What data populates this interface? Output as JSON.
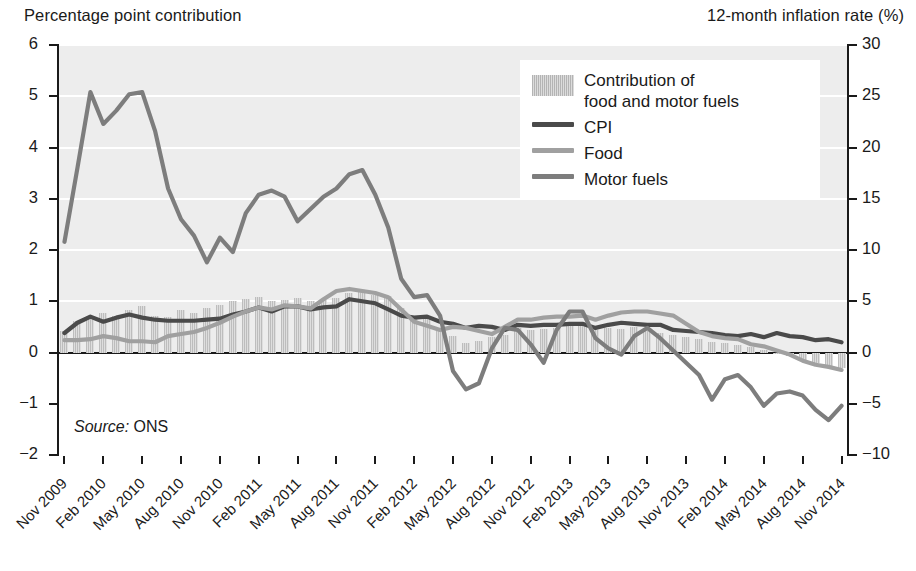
{
  "axes": {
    "left_caption": "Percentage point contribution",
    "right_caption": "12-month inflation rate (%)",
    "left_ticks": [
      "6",
      "5",
      "4",
      "3",
      "2",
      "1",
      "0",
      "-1",
      "-2"
    ],
    "right_ticks": [
      "30",
      "25",
      "20",
      "15",
      "10",
      "5",
      "0",
      "-5",
      "-10"
    ]
  },
  "source": {
    "prefix": "Source:",
    "value": "ONS"
  },
  "legend": {
    "items": [
      {
        "label": "Contribution of\nfood and motor fuels",
        "type": "bar",
        "color": "#c9c9c9"
      },
      {
        "label": "CPI",
        "type": "line",
        "color": "#4a4a4a"
      },
      {
        "label": "Food",
        "type": "line",
        "color": "#a0a0a0"
      },
      {
        "label": "Motor fuels",
        "type": "line",
        "color": "#7d7d7d"
      }
    ]
  },
  "chart_data": {
    "type": "line",
    "title": "",
    "xlabel": "",
    "ylabel": "Percentage point contribution",
    "y2label": "12-month inflation rate (%)",
    "ylim": [
      -2,
      6
    ],
    "y2lim": [
      -10,
      30
    ],
    "grid": true,
    "legend_position": "top-right",
    "x": [
      "Nov 2009",
      "Dec 2009",
      "Jan 2010",
      "Feb 2010",
      "Mar 2010",
      "Apr 2010",
      "May 2010",
      "Jun 2010",
      "Jul 2010",
      "Aug 2010",
      "Sep 2010",
      "Oct 2010",
      "Nov 2010",
      "Dec 2010",
      "Jan 2011",
      "Feb 2011",
      "Mar 2011",
      "Apr 2011",
      "May 2011",
      "Jun 2011",
      "Jul 2011",
      "Aug 2011",
      "Sep 2011",
      "Oct 2011",
      "Nov 2011",
      "Dec 2011",
      "Jan 2012",
      "Feb 2012",
      "Mar 2012",
      "Apr 2012",
      "May 2012",
      "Jun 2012",
      "Jul 2012",
      "Aug 2012",
      "Sep 2012",
      "Oct 2012",
      "Nov 2012",
      "Dec 2012",
      "Jan 2013",
      "Feb 2013",
      "Mar 2013",
      "Apr 2013",
      "May 2013",
      "Jun 2013",
      "Jul 2013",
      "Aug 2013",
      "Sep 2013",
      "Oct 2013",
      "Nov 2013",
      "Dec 2013",
      "Jan 2014",
      "Feb 2014",
      "Mar 2014",
      "Apr 2014",
      "May 2014",
      "Jun 2014",
      "Jul 2014",
      "Aug 2014",
      "Sep 2014",
      "Oct 2014",
      "Nov 2014"
    ],
    "x_tick_labels": [
      "Nov 2009",
      "Feb 2010",
      "May 2010",
      "Aug 2010",
      "Nov 2010",
      "Feb 2011",
      "May 2011",
      "Aug 2011",
      "Nov 2011",
      "Feb 2012",
      "May 2012",
      "Aug 2012",
      "Nov 2012",
      "Feb 2013",
      "May 2013",
      "Aug 2013",
      "Nov 2013",
      "Feb 2014",
      "May 2014",
      "Aug 2014",
      "Nov 2014"
    ],
    "series": [
      {
        "name": "Contribution of food and motor fuels",
        "type": "bar",
        "axis": "left",
        "units": "percentage points",
        "color": "#c9c9c9",
        "values": [
          0.42,
          0.62,
          0.7,
          0.78,
          0.72,
          0.82,
          0.9,
          0.72,
          0.7,
          0.82,
          0.78,
          0.86,
          0.92,
          1.0,
          1.04,
          1.08,
          1.0,
          1.02,
          1.06,
          1.0,
          1.02,
          1.06,
          1.16,
          1.22,
          1.12,
          1.1,
          0.86,
          0.72,
          0.66,
          0.48,
          0.32,
          0.18,
          0.22,
          0.3,
          0.34,
          0.48,
          0.44,
          0.46,
          0.48,
          0.52,
          0.56,
          0.44,
          0.48,
          0.46,
          0.5,
          0.42,
          0.38,
          0.34,
          0.3,
          0.26,
          0.2,
          0.18,
          0.14,
          0.1,
          0.04,
          -0.02,
          -0.06,
          -0.14,
          -0.2,
          -0.26,
          -0.3
        ]
      },
      {
        "name": "CPI",
        "type": "line",
        "axis": "right",
        "units": "%",
        "color": "#4a4a4a",
        "values": [
          1.9,
          2.9,
          3.5,
          3.0,
          3.4,
          3.7,
          3.4,
          3.2,
          3.1,
          3.1,
          3.1,
          3.2,
          3.3,
          3.7,
          4.0,
          4.4,
          4.0,
          4.5,
          4.5,
          4.2,
          4.4,
          4.5,
          5.2,
          5.0,
          4.8,
          4.2,
          3.6,
          3.4,
          3.5,
          3.0,
          2.8,
          2.4,
          2.6,
          2.5,
          2.2,
          2.7,
          2.6,
          2.7,
          2.7,
          2.8,
          2.8,
          2.4,
          2.7,
          2.9,
          2.8,
          2.7,
          2.7,
          2.2,
          2.1,
          2.0,
          1.9,
          1.7,
          1.6,
          1.8,
          1.5,
          1.9,
          1.6,
          1.5,
          1.2,
          1.3,
          1.0
        ]
      },
      {
        "name": "Food",
        "type": "line",
        "axis": "right",
        "units": "%",
        "color": "#a0a0a0",
        "values": [
          1.2,
          1.2,
          1.3,
          1.6,
          1.4,
          1.1,
          1.1,
          1.0,
          1.6,
          1.8,
          2.0,
          2.4,
          2.9,
          3.5,
          4.0,
          4.4,
          4.2,
          4.6,
          4.5,
          4.3,
          5.2,
          6.0,
          6.2,
          6.0,
          5.8,
          5.4,
          4.2,
          3.0,
          2.6,
          2.2,
          2.5,
          2.4,
          2.1,
          1.8,
          2.5,
          3.2,
          3.2,
          3.4,
          3.5,
          3.5,
          3.6,
          3.2,
          3.6,
          3.9,
          4.0,
          4.0,
          3.8,
          3.6,
          2.8,
          2.0,
          1.6,
          1.4,
          1.3,
          0.8,
          0.6,
          0.2,
          -0.2,
          -0.8,
          -1.2,
          -1.4,
          -1.7
        ]
      },
      {
        "name": "Motor fuels",
        "type": "line",
        "axis": "right",
        "units": "%",
        "color": "#7d7d7d",
        "values": [
          10.8,
          18.0,
          25.4,
          22.3,
          23.6,
          25.2,
          25.4,
          21.6,
          16.0,
          13.0,
          11.4,
          8.8,
          11.2,
          9.8,
          13.6,
          15.4,
          15.8,
          15.2,
          12.8,
          14.0,
          15.2,
          16.0,
          17.4,
          17.8,
          15.4,
          12.2,
          7.2,
          5.4,
          5.6,
          3.6,
          -1.8,
          -3.6,
          -3.0,
          0.4,
          2.4,
          2.2,
          0.8,
          -1.0,
          2.2,
          4.0,
          4.0,
          1.4,
          0.4,
          -0.2,
          1.6,
          2.4,
          1.4,
          0.2,
          -1.0,
          -2.2,
          -4.6,
          -2.6,
          -2.2,
          -3.4,
          -5.2,
          -4.0,
          -3.8,
          -4.2,
          -5.6,
          -6.6,
          -5.2
        ]
      }
    ]
  }
}
